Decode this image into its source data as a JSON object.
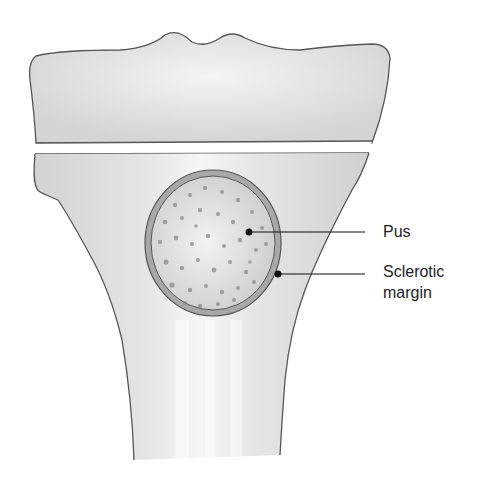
{
  "figure": {
    "type": "anatomical-diagram"
  },
  "labels": {
    "pus": "Pus",
    "sclerotic_margin_line1": "Sclerotic",
    "sclerotic_margin_line2": "margin"
  },
  "colors": {
    "background": "#ffffff",
    "bone_fill": "#e2e2e2",
    "bone_outline": "#555555",
    "abscess_fill": "#d6d6d6",
    "pus_dots": "#8a8a8a",
    "sclerotic_rim": "#a8a8a8",
    "leader_line": "#111111",
    "text": "#222222"
  }
}
